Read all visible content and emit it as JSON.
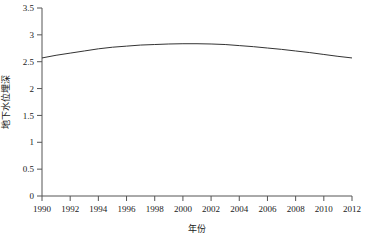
{
  "chart_data": {
    "type": "scatter",
    "title": "",
    "xlabel": "年份",
    "ylabel": "地下水位埋深",
    "xlim": [
      1990,
      2012
    ],
    "ylim": [
      0,
      3.5
    ],
    "grid": false,
    "legend": null,
    "x_ticks": [
      1990,
      1992,
      1994,
      1996,
      1998,
      2000,
      2002,
      2004,
      2006,
      2008,
      2010,
      2012
    ],
    "y_ticks": [
      0,
      0.5,
      1,
      1.5,
      2,
      2.5,
      3,
      3.5
    ],
    "x_tick_labels": [
      "1990",
      "1992",
      "1994",
      "1996",
      "1998",
      "2000",
      "2002",
      "2004",
      "2006",
      "2008",
      "2010",
      "2012"
    ],
    "y_tick_labels": [
      "0",
      "0.5",
      "1",
      "1.5",
      "2",
      "2.5",
      "3",
      "3.5"
    ],
    "marker_style": "diamond",
    "marker_color": "#000000",
    "series": [
      {
        "name": "地下水位埋深",
        "x": [
          1990,
          1991,
          1992,
          1993,
          1994,
          1995,
          1996,
          1997,
          1998,
          1999,
          2000,
          2001,
          2002,
          2003,
          2004,
          2005,
          2006,
          2007,
          2008,
          2009,
          2010,
          2011
        ],
        "values": [
          2.22,
          2.53,
          2.95,
          2.74,
          2.78,
          2.92,
          2.71,
          2.85,
          2.89,
          2.73,
          2.89,
          3.02,
          3.05,
          2.87,
          2.71,
          2.03,
          2.77,
          2.67,
          2.69,
          2.73,
          2.7,
          2.75
        ]
      }
    ],
    "extra_points": [
      {
        "x": 2011.8,
        "y": 2.71
      }
    ],
    "trend": {
      "type": "quadratic_fit",
      "color": "#333333",
      "x": [
        1990,
        1991,
        1992,
        1993,
        1994,
        1995,
        1996,
        1997,
        1998,
        1999,
        2000,
        2001,
        2002,
        2003,
        2004,
        2005,
        2006,
        2007,
        2008,
        2009,
        2010,
        2011,
        2012
      ],
      "y": [
        2.57,
        2.62,
        2.66,
        2.7,
        2.74,
        2.77,
        2.79,
        2.81,
        2.82,
        2.83,
        2.835,
        2.835,
        2.83,
        2.82,
        2.8,
        2.78,
        2.755,
        2.73,
        2.7,
        2.67,
        2.635,
        2.6,
        2.57
      ]
    }
  },
  "axes": {
    "x_axis_name": "year-axis",
    "y_axis_name": "depth-axis"
  }
}
